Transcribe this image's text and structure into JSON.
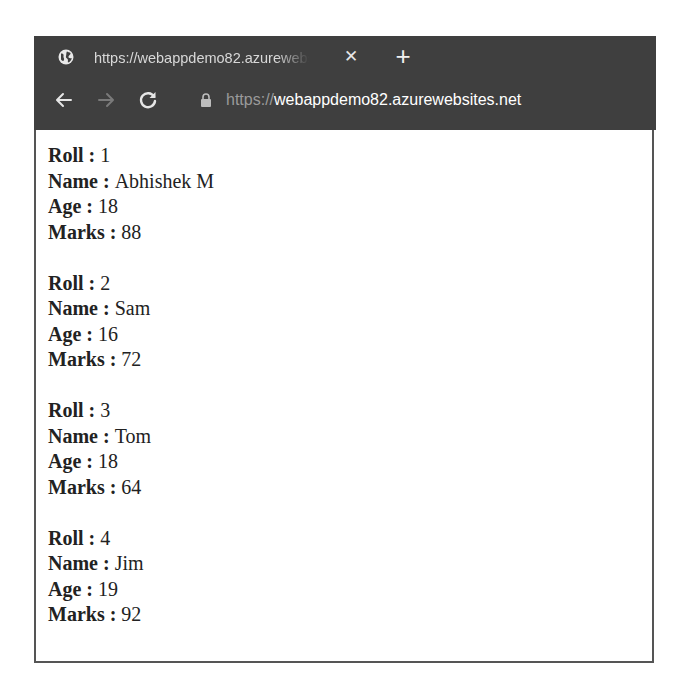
{
  "browser": {
    "tab": {
      "title": "https://webappdemo82.azurewebsites.net",
      "favicon": "globe-icon",
      "close_glyph": "✕"
    },
    "new_tab_glyph": "+",
    "nav": {
      "back_icon": "arrow-left-icon",
      "forward_icon": "arrow-right-icon",
      "reload_icon": "reload-icon"
    },
    "address_bar": {
      "lock_icon": "lock-icon",
      "url_scheme": "https://",
      "url_host": "webappdemo82.azurewebsites.net"
    },
    "colors": {
      "chrome_bg": "#3f3f3f",
      "url_scheme": "#9a9a9a",
      "url_host": "#ffffff"
    }
  },
  "page": {
    "separator": " : ",
    "labels": {
      "roll": "Roll",
      "name": "Name",
      "age": "Age",
      "marks": "Marks"
    },
    "students": [
      {
        "roll": "1",
        "name": "Abhishek M",
        "age": "18",
        "marks": "88"
      },
      {
        "roll": "2",
        "name": "Sam",
        "age": "16",
        "marks": "72"
      },
      {
        "roll": "3",
        "name": "Tom",
        "age": "18",
        "marks": "64"
      },
      {
        "roll": "4",
        "name": "Jim",
        "age": "19",
        "marks": "92"
      }
    ]
  }
}
